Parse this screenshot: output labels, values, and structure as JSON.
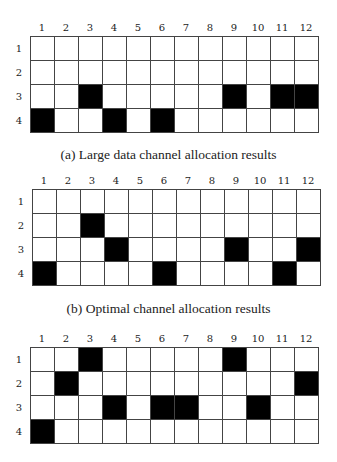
{
  "figure": {
    "columns": [
      "1",
      "2",
      "3",
      "4",
      "5",
      "6",
      "7",
      "8",
      "9",
      "10",
      "11",
      "12"
    ],
    "rows": [
      "1",
      "2",
      "3",
      "4"
    ],
    "fill_color": "#000000",
    "empty_color": "#ffffff",
    "panels": [
      {
        "id": "a",
        "caption": "(a) Large data channel allocation results",
        "filled": {
          "1": [],
          "2": [],
          "3": [
            3,
            9,
            11,
            12
          ],
          "4": [
            1,
            4,
            6
          ]
        }
      },
      {
        "id": "b",
        "caption": "(b) Optimal channel allocation results",
        "filled": {
          "1": [],
          "2": [
            3
          ],
          "3": [
            4,
            9,
            12
          ],
          "4": [
            1,
            6,
            11
          ]
        }
      },
      {
        "id": "c",
        "caption": "",
        "filled": {
          "1": [
            3,
            9
          ],
          "2": [
            2,
            12
          ],
          "3": [
            4,
            6,
            7,
            10
          ],
          "4": [
            1
          ]
        }
      }
    ]
  }
}
